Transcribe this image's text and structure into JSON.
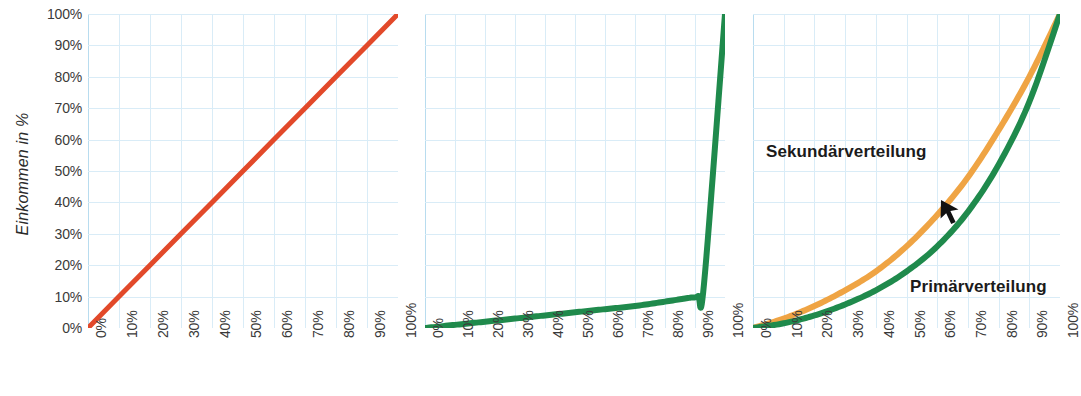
{
  "figure": {
    "axis_titles": {
      "y": "Einkommen in %"
    },
    "colors": {
      "equality_line": "#e2492a",
      "primary_curve": "#1f8a4c",
      "secondary_curve": "#efa444",
      "grid": "#b8dcef",
      "grid_minor": "#d9ecf7",
      "text": "#2b2b2b"
    },
    "tick_labels": [
      "0%",
      "10%",
      "20%",
      "30%",
      "40%",
      "50%",
      "60%",
      "70%",
      "80%",
      "90%",
      "100%"
    ]
  },
  "chart_data": [
    {
      "type": "line",
      "id": "panel-1-gleichverteilung",
      "title": "",
      "xlabel": "",
      "ylabel": "Einkommen in %",
      "xlim": [
        0,
        100
      ],
      "ylim": [
        0,
        100
      ],
      "grid": true,
      "xticks": [
        "0%",
        "10%",
        "20%",
        "30%",
        "40%",
        "50%",
        "60%",
        "70%",
        "80%",
        "90%",
        "100%"
      ],
      "yticks": [
        "0%",
        "10%",
        "20%",
        "30%",
        "40%",
        "50%",
        "60%",
        "70%",
        "80%",
        "90%",
        "100%"
      ],
      "legend": "none",
      "series": [
        {
          "name": "Gleichverteilung",
          "color": "#e2492a",
          "x": [
            0,
            10,
            20,
            30,
            40,
            50,
            60,
            70,
            80,
            90,
            100
          ],
          "values": [
            0,
            10,
            20,
            30,
            40,
            50,
            60,
            70,
            80,
            90,
            100
          ]
        }
      ]
    },
    {
      "type": "line",
      "id": "panel-2-extreme-ungleichverteilung",
      "title": "",
      "xlabel": "",
      "ylabel": "",
      "xlim": [
        0,
        100
      ],
      "ylim": [
        0,
        100
      ],
      "grid": true,
      "xticks": [
        "0%",
        "10%",
        "20%",
        "30%",
        "40%",
        "50%",
        "60%",
        "70%",
        "80%",
        "90%",
        "100%"
      ],
      "yticks": [],
      "legend": "none",
      "series": [
        {
          "name": "Extreme Ungleichverteilung",
          "color": "#1f8a4c",
          "x": [
            0,
            10,
            20,
            30,
            40,
            50,
            60,
            70,
            80,
            88,
            91,
            93,
            100
          ],
          "values": [
            0,
            1,
            2,
            3,
            4,
            5,
            6,
            7,
            8.4,
            9.6,
            10.2,
            14,
            100
          ]
        }
      ]
    },
    {
      "type": "line",
      "id": "panel-3-primaer-sekundaerverteilung",
      "title": "",
      "xlabel": "",
      "ylabel": "",
      "xlim": [
        0,
        100
      ],
      "ylim": [
        0,
        100
      ],
      "grid": true,
      "xticks": [
        "0%",
        "10%",
        "20%",
        "30%",
        "40%",
        "50%",
        "60%",
        "70%",
        "80%",
        "90%",
        "100%"
      ],
      "yticks": [],
      "legend": "in-plot labels",
      "annotations": [
        {
          "text": "Sekundärverteilung",
          "points_to": "secondary_curve"
        },
        {
          "text": "Primärverteilung",
          "points_to": "primary_curve"
        },
        {
          "text": "arrow",
          "points_to": "secondary_curve"
        }
      ],
      "series": [
        {
          "name": "Sekundärverteilung",
          "color": "#efa444",
          "x": [
            0,
            10,
            20,
            30,
            40,
            50,
            60,
            70,
            80,
            90,
            100
          ],
          "values": [
            0,
            3,
            7,
            12,
            18,
            26,
            36,
            48,
            63,
            80,
            100
          ]
        },
        {
          "name": "Primärverteilung",
          "color": "#1f8a4c",
          "x": [
            0,
            10,
            20,
            30,
            40,
            50,
            60,
            70,
            80,
            90,
            100
          ],
          "values": [
            0,
            1.5,
            4,
            7.5,
            12,
            18,
            26,
            37,
            52,
            72,
            100
          ]
        }
      ]
    }
  ],
  "panels": [
    {
      "name": "gleichverteilung",
      "annotations": []
    },
    {
      "name": "extreme-ungleichverteilung",
      "annotations": []
    },
    {
      "name": "primaer-sekundaerverteilung",
      "annotations": {
        "secondary_label": "Sekundärverteilung",
        "primary_label": "Primärverteilung"
      }
    }
  ]
}
